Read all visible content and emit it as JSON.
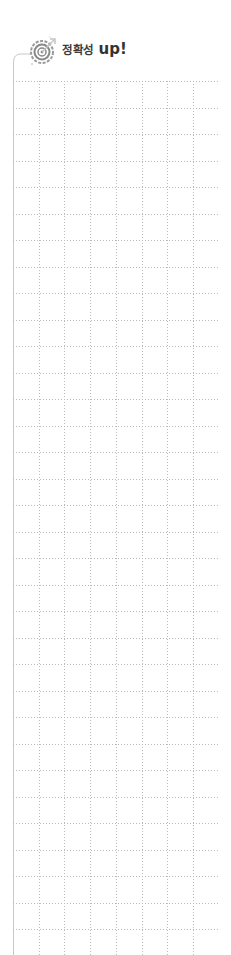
{
  "header": {
    "title_korean": "정확성",
    "title_up": "up!",
    "icon": "target-icon"
  },
  "grid": {
    "columns": 8,
    "rows": 33,
    "cell_width": 25.7,
    "cell_height": 26.5,
    "line_style": "dotted",
    "line_color": "#b9b9b9",
    "border_color": "#c8c8c8"
  }
}
